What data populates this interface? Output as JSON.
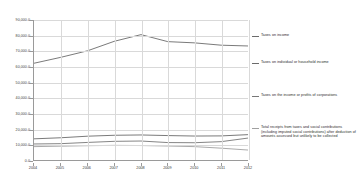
{
  "chart_data": {
    "type": "line",
    "title": "",
    "subtitle": "",
    "xlabel": "",
    "ylabel": "",
    "x": [
      2004,
      2005,
      2006,
      2007,
      2008,
      2009,
      2010,
      2011,
      2012
    ],
    "xtick_labels": [
      "2004",
      "2005",
      "2006",
      "2007",
      "2008",
      "2009",
      "2010",
      "2011",
      "2012"
    ],
    "ytick_labels": [
      "0.0",
      "10,000.0",
      "20,000.0",
      "30,000.0",
      "40,000.0",
      "50,000.0",
      "60,000.0",
      "70,000.0",
      "80,000.0",
      "90,000.0"
    ],
    "ytick_values": [
      0,
      10000,
      20000,
      30000,
      40000,
      50000,
      60000,
      70000,
      80000,
      90000
    ],
    "ylim": [
      0,
      90000
    ],
    "xlim": [
      2004,
      2012
    ],
    "grid": true,
    "legend_position": "right",
    "series": [
      {
        "name": "Taxes on income",
        "color": "#6b6b6b",
        "values": [
          62200,
          66000,
          70200,
          76300,
          80600,
          76100,
          75300,
          73800,
          73300
        ]
      },
      {
        "name": "Taxes on individual or household income",
        "color": "#6b6b6b",
        "values": [
          13600,
          14300,
          15300,
          15900,
          16100,
          15700,
          15400,
          15500,
          16300
        ]
      },
      {
        "name": "Taxes on the income or profits of corporations",
        "color": "#777777",
        "values": [
          10300,
          10500,
          11300,
          12000,
          12200,
          11200,
          11100,
          11800,
          14100
        ]
      },
      {
        "name": "Total receipts from taxes and social contributions (including imputed social contributions) after deduction of amounts assessed but unlikely to be collected",
        "color": "#a0a0a0",
        "values": [
          8600,
          8900,
          9200,
          9400,
          9300,
          9000,
          8600,
          7600,
          6400
        ]
      }
    ]
  },
  "legend": {
    "items": [
      {
        "label": "Taxes on income"
      },
      {
        "label": "Taxes on individual or household income"
      },
      {
        "label": "Taxes on the income or profits of corporations"
      },
      {
        "label": "Total receipts from taxes and social contributions (including imputed social contributions) after deduction of amounts assessed but unlikely to be collected"
      }
    ]
  },
  "colors": {
    "background": "#ffffff",
    "gridline": "#d9d9d9",
    "axis": "#9a9a9a",
    "text": "#2b2b2b"
  }
}
